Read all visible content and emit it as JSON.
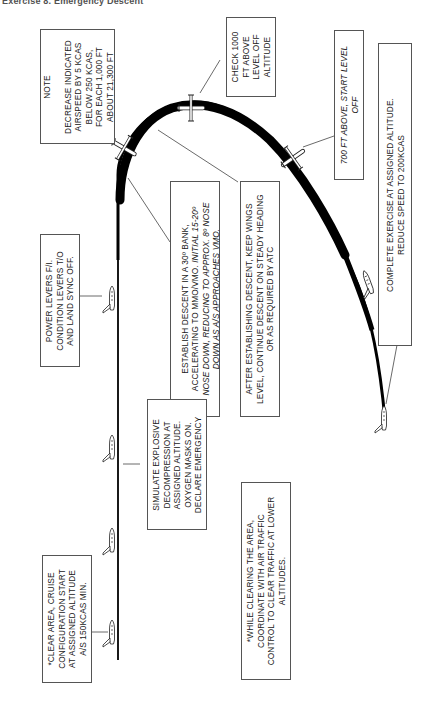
{
  "header": {
    "text": "Exercise 8. Emergency Descent",
    "faint": ""
  },
  "diagram": {
    "path_color": "#000000",
    "box_border": "#555555",
    "notes": {
      "note_title": "NOTE",
      "note_body": "DECREASE INDICATED\nAIRSPEED BY 5 KCAS\nBELOW 250 KCAS,\nFOR EACH 1,000 FT\nABOUT 21,300 FT",
      "check_1000": "CHECK 1000\nFT ABOVE\nLEVEL OFF\nALTITUDE",
      "ft_700": "700 FT ABOVE, START LEVEL\nOFF",
      "complete": "COMPLETE EXERCISE AT ASSIGNED ALTITUDE.\nREDUCE SPEED TO 200KCAS",
      "power_levers": "POWER LEVERS F/I.\nCONDITION LEVERS T/O\nAND LAND SYNC OFF.",
      "establish_a": "ESTABLISH DESCENT IN A 30º BANK,\nACCELERATING TO MMO/VMO.",
      "establish_b": " INITIAL 15-20º\nNOSE DOWN, REDUCING TO APPROX. 8º NOSE\nDOWN AS A/S APPROACHES VMO.",
      "after_establishing": "AFTER ESTABLISHING DESCENT, KEEP WINGS\nLEVEL, CONTINUE DESCENT ON STEADY HEADING\nOR AS REQUIRED BY ATC",
      "simulate": "SIMULATE EXPLOSIVE\nDECOMPRESSION AT\nASSIGNED ALTITUDE.\nOXYGEN MASKS ON.\nDECLARE EMERGENCY",
      "clear_area": "*CLEAR AREA, CRUISE\nCONFIGURATION START\nAT ASSIGNED ALTITUDE\nA/S 150KCAS MIN.",
      "while_clearing": "*WHILE CLEARING THE AREA,\nCOORDINATE WITH AIR TRAFFIC\nCONTROL TO CLEAR TRAFFIC AT LOWER\nALTITUDES."
    }
  }
}
